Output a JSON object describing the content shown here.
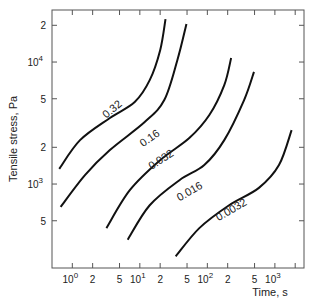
{
  "chart_data": {
    "type": "line",
    "title": "",
    "xlabel": "Time, s",
    "ylabel": "Tensile stress, Pa",
    "xscale": "log",
    "yscale": "log",
    "xlim": [
      0.5,
      2700
    ],
    "ylim": [
      205,
      26700
    ],
    "grid": false,
    "legend": "inline curve labels",
    "x_ticks": [
      {
        "value": 1,
        "label": "10",
        "exp": "0",
        "major": true
      },
      {
        "value": 2,
        "label": "2",
        "major": false
      },
      {
        "value": 5,
        "label": "5",
        "major": false
      },
      {
        "value": 10,
        "label": "10",
        "exp": "1",
        "major": true
      },
      {
        "value": 20,
        "label": "2",
        "major": false
      },
      {
        "value": 50,
        "label": "5",
        "major": false
      },
      {
        "value": 100,
        "label": "10",
        "exp": "2",
        "major": true
      },
      {
        "value": 200,
        "label": "2",
        "major": false
      },
      {
        "value": 500,
        "label": "5",
        "major": false
      },
      {
        "value": 1000,
        "label": "10",
        "exp": "3",
        "major": true
      },
      {
        "value": 2000,
        "label": "",
        "major": false
      }
    ],
    "y_ticks": [
      {
        "value": 500,
        "label": "5",
        "major": false
      },
      {
        "value": 1000,
        "label": "10",
        "exp": "3",
        "major": true
      },
      {
        "value": 2000,
        "label": "2",
        "major": false
      },
      {
        "value": 5000,
        "label": "5",
        "major": false
      },
      {
        "value": 10000,
        "label": "10",
        "exp": "4",
        "major": true
      },
      {
        "value": 20000,
        "label": "2",
        "major": false
      }
    ],
    "series": [
      {
        "name": "0.32",
        "label_pos": {
          "x": 4.2,
          "y": 3900,
          "angle": -40
        },
        "x": [
          0.64,
          1.3,
          3.6,
          8.4,
          14,
          20,
          24
        ],
        "y": [
          1330,
          2290,
          3480,
          4700,
          7100,
          12500,
          22500
        ]
      },
      {
        "name": "0.16",
        "label_pos": {
          "x": 15,
          "y": 2250,
          "angle": -35
        },
        "x": [
          0.67,
          1.55,
          3.6,
          11.8,
          23,
          36,
          49
        ],
        "y": [
          650,
          1190,
          1900,
          3220,
          4880,
          10400,
          20500
        ]
      },
      {
        "name": "0.032",
        "label_pos": {
          "x": 22,
          "y": 1500,
          "angle": -33
        },
        "x": [
          3.2,
          7.1,
          20,
          54,
          107,
          178,
          225
        ],
        "y": [
          435,
          890,
          1570,
          2380,
          3680,
          6470,
          10800
        ]
      },
      {
        "name": "0.016",
        "label_pos": {
          "x": 58,
          "y": 820,
          "angle": -30
        },
        "x": [
          6.6,
          14,
          39,
          90,
          178,
          350,
          490
        ],
        "y": [
          350,
          670,
          1080,
          1430,
          2290,
          4880,
          8300
        ]
      },
      {
        "name": "0.0032",
        "label_pos": {
          "x": 240,
          "y": 580,
          "angle": -30
        },
        "x": [
          34,
          76,
          210,
          580,
          1150,
          1770
        ],
        "y": [
          255,
          435,
          670,
          930,
          1430,
          2770
        ]
      }
    ]
  },
  "axes": {
    "x_title": "Time, s",
    "y_title": "Tensile stress, Pa"
  },
  "style": {
    "line_color": "#111111",
    "frame_color": "#555555"
  }
}
